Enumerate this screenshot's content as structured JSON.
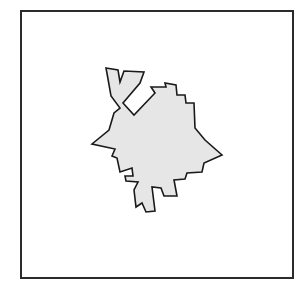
{
  "figure": {
    "canvas": {
      "width": 307,
      "height": 300,
      "background_color": "#ffffff"
    },
    "frame": {
      "name": "border-rectangle",
      "x": 21,
      "y": 11,
      "width": 272,
      "height": 267,
      "stroke_color": "#2b2b2b",
      "stroke_width": 2,
      "fill": "none"
    },
    "shape": {
      "name": "irregular-polygon",
      "fill_color": "#e6e6e6",
      "stroke_color": "#1a1a1a",
      "stroke_width": 1.6,
      "vertex_count": 38,
      "points": "106,68 118,70 120,82 124,71 144,72 140,83 123,103 134,115 155,93 151,87 166,87 165,83 176,85 177,95 185,95 186,103 194,103 195,128 205,140 222,155 204,163 202,172 187,173 185,179 174,180 177,196 164,196 161,188 152,187 155,211 146,212 142,203 136,207 134,190 138,182 126,181 125,176 133,176 132,168 120,172 117,158 112,156 115,149 92,144 109,130 114,113 120,108 111,96 108,79",
      "bbox": {
        "x": 92,
        "y": 68,
        "width": 130,
        "height": 144
      }
    }
  }
}
